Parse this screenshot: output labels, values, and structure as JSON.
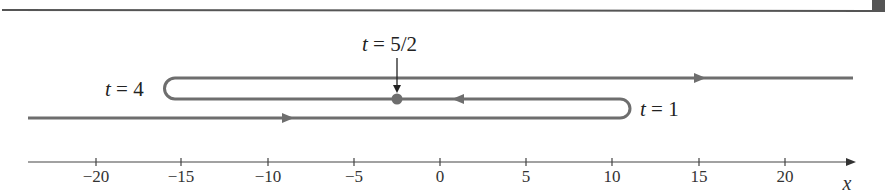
{
  "figure": {
    "labels": {
      "t_half": {
        "var": "t",
        "eq": " = 5/2"
      },
      "t_four": {
        "var": "t",
        "eq": " = 4"
      },
      "t_one": {
        "var": "t",
        "eq": " = 1"
      }
    },
    "axis": {
      "label": "x",
      "ticks": [
        "−20",
        "−15",
        "−10",
        "−5",
        "0",
        "5",
        "10",
        "15",
        "20"
      ]
    },
    "colors": {
      "curve": "#6e6e6e",
      "axis": "#444444",
      "rule": "#555555"
    }
  }
}
